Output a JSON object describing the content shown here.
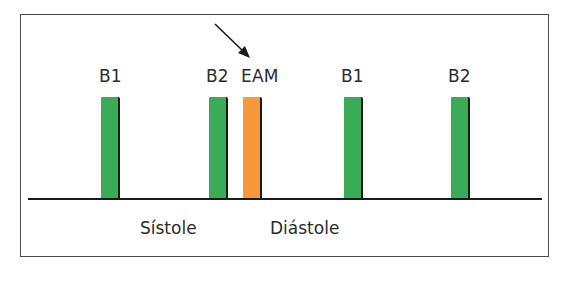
{
  "diagram": {
    "colors": {
      "normal_sound": "#3aab57",
      "extra_sound": "#f7983a",
      "line": "#1a1a1a",
      "text": "#2b2b2b"
    },
    "sounds": [
      {
        "label": "B1",
        "type": "normal",
        "x": 101
      },
      {
        "label": "B2",
        "type": "normal",
        "x": 209
      },
      {
        "label": "EAM",
        "type": "extra",
        "x": 243
      },
      {
        "label": "B1",
        "type": "normal",
        "x": 344
      },
      {
        "label": "B2",
        "type": "normal",
        "x": 451
      }
    ],
    "phases": [
      {
        "label": "Sístole",
        "x": 140
      },
      {
        "label": "Diástole",
        "x": 270
      }
    ],
    "arrow": {
      "target": "EAM"
    }
  }
}
